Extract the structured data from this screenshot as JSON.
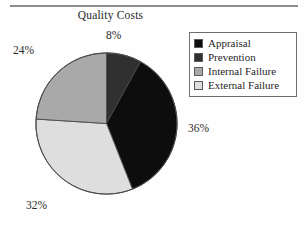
{
  "figure": {
    "title": "Quality Costs"
  },
  "legend": {
    "items": [
      {
        "label": "Appraisal",
        "swatch": "#0d0d0d"
      },
      {
        "label": "Prevention",
        "swatch": "#303030"
      },
      {
        "label": "Internal Failure",
        "swatch": "#a9a9a9"
      },
      {
        "label": "External Failure",
        "swatch": "#dedede"
      }
    ]
  },
  "labels": {
    "prevention": "8%",
    "appraisal": "36%",
    "external": "32%",
    "internal": "24%"
  },
  "chart_data": {
    "type": "pie",
    "title": "Quality Costs",
    "xlabel": "",
    "ylabel": "",
    "legend_position": "top-right",
    "start_angle_deg": 0,
    "direction": "clockwise",
    "categories": [
      "Prevention",
      "Appraisal",
      "External Failure",
      "Internal Failure"
    ],
    "values": [
      8,
      36,
      32,
      24
    ],
    "value_labels": [
      "8%",
      "36%",
      "32%",
      "24%"
    ],
    "units": "percent",
    "total": 100,
    "colors": [
      "#303030",
      "#0d0d0d",
      "#dedede",
      "#a9a9a9"
    ],
    "slices": [
      {
        "name": "Prevention",
        "value": 8,
        "label": "8%",
        "color": "#303030",
        "start_deg": 0,
        "end_deg": 28.8,
        "label_position": "top"
      },
      {
        "name": "Appraisal",
        "value": 36,
        "label": "36%",
        "color": "#0d0d0d",
        "start_deg": 28.8,
        "end_deg": 158.4,
        "label_position": "right"
      },
      {
        "name": "External Failure",
        "value": 32,
        "label": "32%",
        "color": "#dedede",
        "start_deg": 158.4,
        "end_deg": 273.6,
        "label_position": "bottom-left"
      },
      {
        "name": "Internal Failure",
        "value": 24,
        "label": "24%",
        "color": "#a9a9a9",
        "start_deg": 273.6,
        "end_deg": 360,
        "label_position": "top-left"
      }
    ]
  }
}
